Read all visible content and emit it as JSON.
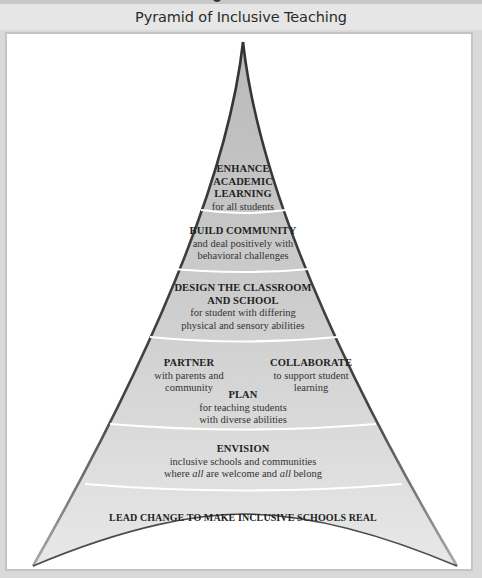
{
  "figure": {
    "title": "Pyramid of Inclusive Teaching",
    "colors": {
      "title_bar": "#e6e6e6",
      "frame_border": "#c4c4c4",
      "pyramid_fill_top": "#bdbdbd",
      "pyramid_fill_bottom": "#e4e4e4",
      "pyramid_edge": "#3a3a3a",
      "separator": "#ffffff"
    }
  },
  "levels": [
    {
      "heading_lines": [
        "ENHANCE",
        "ACADEMIC",
        "LEARNING"
      ],
      "heading": "ENHANCE ACADEMIC LEARNING",
      "sub_lines": [
        "for all students"
      ]
    },
    {
      "heading": "BUILD COMMUNITY",
      "sub_lines": [
        "and deal positively with",
        "behavioral challenges"
      ]
    },
    {
      "heading_lines": [
        "DESIGN THE CLASSROOM",
        "AND SCHOOL"
      ],
      "heading": "DESIGN THE CLASSROOM AND SCHOOL",
      "sub_lines": [
        "for student with differing",
        "physical and sensory abilities"
      ]
    },
    {
      "items": [
        {
          "heading": "PARTNER",
          "sub_lines": [
            "with parents and",
            "community"
          ]
        },
        {
          "heading": "COLLABORATE",
          "sub_lines": [
            "to support student",
            "learning"
          ]
        },
        {
          "heading": "PLAN",
          "sub_lines": [
            "for teaching students",
            "with diverse abilities"
          ]
        }
      ]
    },
    {
      "heading": "ENVISION",
      "sub_lines": [
        "inclusive schools and communities"
      ],
      "sub_rich": {
        "p1": "where ",
        "em1": "all",
        "p2": " are welcome and ",
        "em2": "all",
        "p3": " belong"
      }
    },
    {
      "heading": "LEAD CHANGE TO MAKE INCLUSIVE SCHOOLS REAL"
    }
  ]
}
